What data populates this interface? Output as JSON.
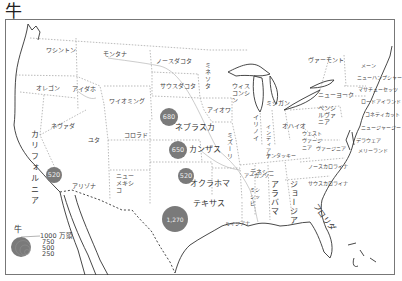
{
  "title": "牛",
  "map": {
    "states": [
      {
        "name": "ワシントン",
        "x": 46,
        "y": 46
      },
      {
        "name": "モンタナ",
        "x": 103,
        "y": 50
      },
      {
        "name": "ノースダコタ",
        "x": 156,
        "y": 57
      },
      {
        "name": "オレゴン",
        "x": 36,
        "y": 84
      },
      {
        "name": "アイダホ",
        "x": 72,
        "y": 85
      },
      {
        "name": "サウスダコタ",
        "x": 160,
        "y": 82
      },
      {
        "name": "ワイオミング",
        "x": 109,
        "y": 97
      },
      {
        "name": "ミネソタ",
        "x": 206,
        "y": 70
      },
      {
        "name": "ウィスコンシン",
        "x": 233,
        "y": 83
      },
      {
        "name": "ミシガン",
        "x": 268,
        "y": 99
      },
      {
        "name": "アイオワ",
        "x": 207,
        "y": 106
      },
      {
        "name": "ネブラスカ",
        "x": 175,
        "y": 124
      },
      {
        "name": "ネヴァダ",
        "x": 51,
        "y": 122
      },
      {
        "name": "ユタ",
        "x": 88,
        "y": 136
      },
      {
        "name": "コロラド",
        "x": 124,
        "y": 131
      },
      {
        "name": "カンザス",
        "x": 190,
        "y": 150
      },
      {
        "name": "ミズーリ",
        "x": 227,
        "y": 140
      },
      {
        "name": "イリノイ",
        "x": 253,
        "y": 122
      },
      {
        "name": "インディアナ",
        "x": 266,
        "y": 133
      },
      {
        "name": "オハイオ",
        "x": 285,
        "y": 122
      },
      {
        "name": "ウェストヴァージニア",
        "x": 300,
        "y": 133
      },
      {
        "name": "ヴァージニア",
        "x": 320,
        "y": 145
      },
      {
        "name": "ケンタッキー",
        "x": 268,
        "y": 152
      },
      {
        "name": "ペンシルヴァニア",
        "x": 318,
        "y": 106
      },
      {
        "name": "ニューヨーク",
        "x": 320,
        "y": 91
      },
      {
        "name": "ヴァーモント",
        "x": 309,
        "y": 56
      },
      {
        "name": "メーン",
        "x": 362,
        "y": 64
      },
      {
        "name": "ニューハンプシャー",
        "x": 358,
        "y": 76
      },
      {
        "name": "マサチューセッツ",
        "x": 360,
        "y": 87
      },
      {
        "name": "ロードアイランド",
        "x": 361,
        "y": 99
      },
      {
        "name": "コネティカット",
        "x": 365,
        "y": 113
      },
      {
        "name": "ニュージャージー",
        "x": 361,
        "y": 126
      },
      {
        "name": "デラウェア",
        "x": 356,
        "y": 138
      },
      {
        "name": "メリーランド",
        "x": 358,
        "y": 147
      },
      {
        "name": "カリフォルニア",
        "x": 30,
        "y": 160
      },
      {
        "name": "アリゾナ",
        "x": 72,
        "y": 182
      },
      {
        "name": "ニューメキシコ",
        "x": 117,
        "y": 176
      },
      {
        "name": "オクラホマ",
        "x": 193,
        "y": 180
      },
      {
        "name": "アーカンソー",
        "x": 245,
        "y": 173
      },
      {
        "name": "テネシー",
        "x": 263,
        "y": 168
      },
      {
        "name": "ノースカロライナ",
        "x": 316,
        "y": 164
      },
      {
        "name": "サウスカロライナ",
        "x": 310,
        "y": 180
      },
      {
        "name": "ミシシッピ",
        "x": 253,
        "y": 190
      },
      {
        "name": "アラバマ",
        "x": 273,
        "y": 190
      },
      {
        "name": "ジョージア",
        "x": 291,
        "y": 190
      },
      {
        "name": "テキサス",
        "x": 204,
        "y": 204
      },
      {
        "name": "ルイジアナ",
        "x": 230,
        "y": 222
      },
      {
        "name": "フロリダ",
        "x": 318,
        "y": 220
      }
    ],
    "bubbles": [
      {
        "state": "ネブラスカ",
        "value": "680",
        "cx": 169,
        "cy": 117,
        "r": 9
      },
      {
        "state": "カンザス",
        "value": "650",
        "cx": 178,
        "cy": 150,
        "r": 9
      },
      {
        "state": "オクラホマ",
        "value": "520",
        "cx": 186,
        "cy": 176,
        "r": 8
      },
      {
        "state": "カリフォルニア",
        "value": "520",
        "cx": 54,
        "cy": 175,
        "r": 8
      },
      {
        "state": "テキサス",
        "value": "1,270",
        "cx": 175,
        "cy": 219,
        "r": 13
      }
    ]
  },
  "legend": {
    "title": "牛",
    "unit": "万頭",
    "values": [
      "1000",
      "750",
      "500",
      "250"
    ],
    "top_label": "1000 万頭"
  }
}
